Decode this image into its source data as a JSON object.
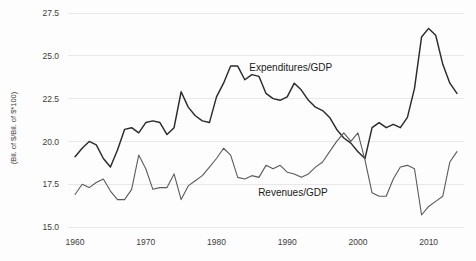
{
  "chart_data": {
    "type": "line",
    "title": "",
    "subtitle": "",
    "xlabel": "",
    "ylabel": "(Bil. of $/Bil. of $*100)",
    "xlim": [
      1959,
      2015
    ],
    "ylim": [
      15.0,
      27.5
    ],
    "grid": true,
    "grid_axis": "y",
    "legend": "inline-annotations",
    "ytick_labels": [
      "27.5",
      "25.0",
      "22.5",
      "20.0",
      "17.5",
      "15.0"
    ],
    "ytick_values": [
      27.5,
      25.0,
      22.5,
      20.0,
      17.5,
      15.0
    ],
    "xtick_labels": [
      "1960",
      "1970",
      "1980",
      "1990",
      "2000",
      "2010"
    ],
    "xtick_values": [
      1960,
      1970,
      1980,
      1990,
      2000,
      2010
    ],
    "x": [
      1960,
      1961,
      1962,
      1963,
      1964,
      1965,
      1966,
      1967,
      1968,
      1969,
      1970,
      1971,
      1972,
      1973,
      1974,
      1975,
      1976,
      1977,
      1978,
      1979,
      1980,
      1981,
      1982,
      1983,
      1984,
      1985,
      1986,
      1987,
      1988,
      1989,
      1990,
      1991,
      1992,
      1993,
      1994,
      1995,
      1996,
      1997,
      1998,
      1999,
      2000,
      2001,
      2002,
      2003,
      2004,
      2005,
      2006,
      2007,
      2008,
      2009,
      2010,
      2011,
      2012,
      2013,
      2014
    ],
    "series": [
      {
        "name": "Expenditures/GDP",
        "color": "#2b2b2b",
        "label_x": 1990.5,
        "label_y": 24.1,
        "values": [
          19.1,
          19.6,
          20.0,
          19.8,
          19.0,
          18.5,
          19.5,
          20.7,
          20.8,
          20.5,
          21.1,
          21.2,
          21.1,
          20.4,
          20.8,
          22.9,
          22.0,
          21.5,
          21.2,
          21.1,
          22.6,
          23.4,
          24.4,
          24.4,
          23.6,
          23.9,
          23.8,
          22.8,
          22.5,
          22.4,
          22.6,
          23.4,
          23.0,
          22.4,
          22.0,
          21.8,
          21.4,
          20.7,
          20.2,
          19.9,
          19.4,
          19.0,
          20.8,
          21.1,
          20.8,
          21.0,
          20.8,
          21.4,
          23.1,
          26.1,
          26.6,
          26.2,
          24.5,
          23.4,
          22.8
        ]
      },
      {
        "name": "Revenues/GDP",
        "color": "#5a5a5a",
        "label_x": 1990.8,
        "label_y": 16.8,
        "values": [
          16.9,
          17.5,
          17.3,
          17.6,
          17.8,
          17.1,
          16.6,
          16.6,
          17.2,
          19.2,
          18.4,
          17.2,
          17.3,
          17.3,
          18.1,
          16.6,
          17.4,
          17.7,
          18.0,
          18.5,
          19.0,
          19.6,
          19.2,
          17.9,
          17.8,
          18.0,
          17.9,
          18.6,
          18.4,
          18.6,
          18.2,
          18.1,
          17.9,
          18.1,
          18.5,
          18.8,
          19.4,
          20.0,
          20.5,
          20.0,
          20.5,
          18.9,
          17.0,
          16.8,
          16.8,
          17.8,
          18.5,
          18.6,
          18.4,
          15.7,
          16.2,
          16.5,
          16.8,
          18.8,
          19.4
        ]
      }
    ]
  }
}
